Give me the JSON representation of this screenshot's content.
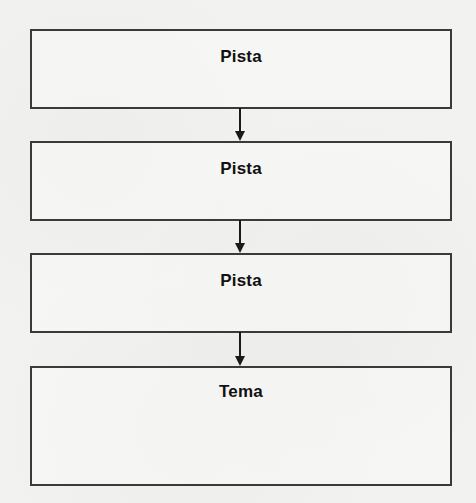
{
  "diagram": {
    "type": "flowchart",
    "direction": "top-to-bottom",
    "nodes": [
      {
        "id": "box-1",
        "label": "Pista"
      },
      {
        "id": "box-2",
        "label": "Pista"
      },
      {
        "id": "box-3",
        "label": "Pista"
      },
      {
        "id": "box-4",
        "label": "Tema"
      }
    ],
    "edges": [
      {
        "from": "box-1",
        "to": "box-2",
        "icon": "arrow-down-icon"
      },
      {
        "from": "box-2",
        "to": "box-3",
        "icon": "arrow-down-icon"
      },
      {
        "from": "box-3",
        "to": "box-4",
        "icon": "arrow-down-icon"
      }
    ],
    "colors": {
      "border": "#3a3a3a",
      "text": "#111111",
      "background": "#f2f2f0"
    }
  }
}
